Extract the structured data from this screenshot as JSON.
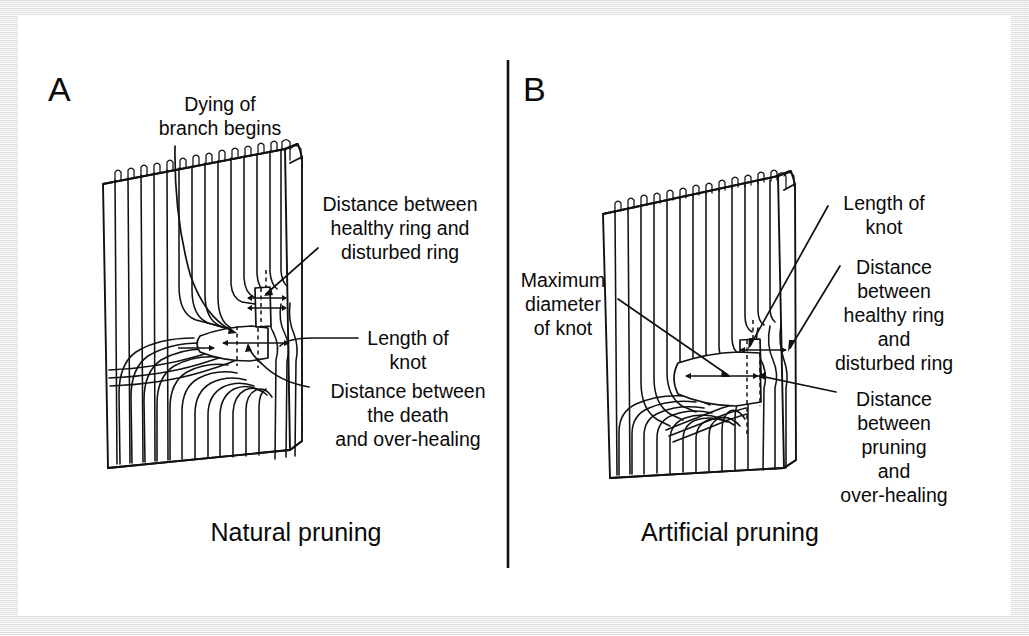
{
  "figure": {
    "background_color": "#ffffff",
    "border_color": "#f2f2f0",
    "ink_color": "#111111"
  },
  "panels": [
    {
      "id": "A",
      "panel_label": "A",
      "caption": "Natural pruning",
      "annotations": [
        {
          "key": "dying-branch",
          "lines": [
            "Dying of",
            "branch begins"
          ],
          "align": "middle"
        },
        {
          "key": "healthy-disturbed",
          "lines": [
            "Distance between",
            "healthy ring and",
            "disturbed ring"
          ],
          "align": "middle"
        },
        {
          "key": "length-of-knot",
          "lines": [
            "Length of",
            "knot"
          ],
          "align": "middle"
        },
        {
          "key": "death-overhealing",
          "lines": [
            "Distance between",
            "the death",
            "and over-healing"
          ],
          "align": "middle"
        }
      ]
    },
    {
      "id": "B",
      "panel_label": "B",
      "caption": "Artificial pruning",
      "annotations": [
        {
          "key": "max-diameter",
          "lines": [
            "Maximum",
            "diameter",
            "of knot"
          ],
          "align": "middle"
        },
        {
          "key": "length-of-knot",
          "lines": [
            "Length of",
            "knot"
          ],
          "align": "middle"
        },
        {
          "key": "healthy-disturbed",
          "lines": [
            "Distance",
            "between",
            "healthy ring",
            "and",
            "disturbed ring"
          ],
          "align": "middle"
        },
        {
          "key": "pruning-overhealing",
          "lines": [
            "Distance",
            "between",
            "pruning",
            "and",
            "over-healing"
          ],
          "align": "middle"
        }
      ]
    }
  ]
}
